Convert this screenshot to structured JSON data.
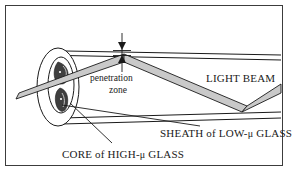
{
  "figure": {
    "border_color": "#3c3c3c",
    "background": "#ffffff",
    "line_color": "#1a1a1a",
    "beam_fill": "#c9c9c9",
    "core_fill": "#4a4a4a"
  },
  "labels": {
    "light_beam": "LIGHT BEAM",
    "penetration_line1": "penetration",
    "penetration_line2": "zone",
    "sheath_pre": "SHEATH of LOW-",
    "sheath_post": " GLASS",
    "core_pre": "CORE of HIGH-",
    "core_post": " GLASS",
    "mu": "μ"
  },
  "parts": {
    "outer_ellipse": "sheath-cross-section",
    "inner_ellipse": "core-cross-section",
    "dimension_marker": "penetration-zone-depth-arrows",
    "beam_path": "reflected-light-ray",
    "leader_core": "core-leader-line",
    "leader_sheath": "sheath-leader-line"
  }
}
